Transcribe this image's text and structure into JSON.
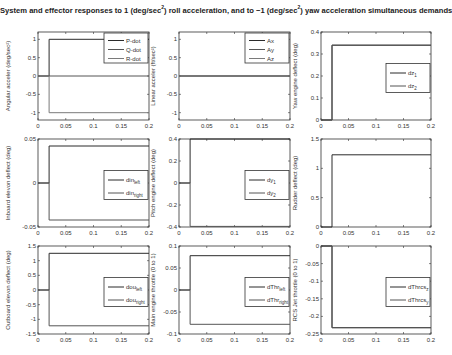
{
  "figure": {
    "title_parts": [
      "System and effector responses to 1 (deg/sec",
      "2",
      ") roll acceleration, and to −1 (deg/sec",
      "2",
      ") yaw acceleration simultaneous demands"
    ]
  },
  "chart_data": [
    {
      "type": "line",
      "id": "angular-accel",
      "ylabel": "Angular acceler (deg/sec²)",
      "xlim": [
        0,
        0.2
      ],
      "ylim": [
        -1.2,
        1.2
      ],
      "xticks": [
        0,
        0.05,
        0.1,
        0.15,
        0.2
      ],
      "xticklabels": [
        "0",
        "0.05",
        "0.1",
        "0.15",
        "0.2"
      ],
      "yticks": [
        -1,
        -0.5,
        0,
        0.5,
        1
      ],
      "yticklabels": [
        "-1",
        "-0.5",
        "0",
        "0.5",
        "1"
      ],
      "legend": {
        "position": "upper-right",
        "entries": [
          {
            "label": "P-dot"
          },
          {
            "label": "Q-dot"
          },
          {
            "label": "R-dot"
          }
        ]
      },
      "series": [
        {
          "name": "P-dot",
          "x": [
            0,
            0.02,
            0.02,
            0.2
          ],
          "y": [
            0,
            0,
            1,
            1
          ]
        },
        {
          "name": "Q-dot",
          "x": [
            0,
            0.2
          ],
          "y": [
            0,
            0
          ]
        },
        {
          "name": "R-dot",
          "x": [
            0,
            0.02,
            0.02,
            0.2
          ],
          "y": [
            0,
            0,
            -1,
            -1
          ]
        }
      ]
    },
    {
      "type": "line",
      "id": "linear-accel",
      "ylabel": "Linear acceler (ft/sec²)",
      "xlim": [
        0,
        0.2
      ],
      "ylim": [
        -1.2,
        1.2
      ],
      "xticks": [
        0,
        0.05,
        0.1,
        0.15,
        0.2
      ],
      "xticklabels": [
        "0",
        "0.05",
        "0.1",
        "0.15",
        "0.2"
      ],
      "yticks": [
        -1,
        -0.5,
        0,
        0.5,
        1
      ],
      "yticklabels": [
        "-1",
        "-0.5",
        "0",
        "0.5",
        "1"
      ],
      "legend": {
        "position": "upper-right",
        "entries": [
          {
            "label": "Ax"
          },
          {
            "label": "Ay"
          },
          {
            "label": "Az"
          }
        ]
      },
      "series": [
        {
          "name": "Ax",
          "x": [
            0,
            0.2
          ],
          "y": [
            0,
            0
          ]
        },
        {
          "name": "Ay",
          "x": [
            0,
            0.2
          ],
          "y": [
            0,
            0
          ]
        },
        {
          "name": "Az",
          "x": [
            0,
            0.2
          ],
          "y": [
            0,
            0
          ]
        }
      ]
    },
    {
      "type": "line",
      "id": "yaw-engine-deflect",
      "ylabel": "Yaw engine deflect (deg)",
      "xlim": [
        0,
        0.2
      ],
      "ylim": [
        0,
        0.4
      ],
      "xticks": [
        0,
        0.05,
        0.1,
        0.15,
        0.2
      ],
      "xticklabels": [
        "0",
        "0.05",
        "0.1",
        "0.15",
        "0.2"
      ],
      "yticks": [
        0,
        0.1,
        0.2,
        0.3,
        0.4
      ],
      "yticklabels": [
        "0",
        "0.1",
        "0.2",
        "0.3",
        "0.4"
      ],
      "legend": {
        "position": "right",
        "entries": [
          {
            "label": "dz",
            "sub": "1"
          },
          {
            "label": "dz",
            "sub": "2"
          }
        ]
      },
      "series": [
        {
          "name": "dz1",
          "x": [
            0,
            0.02,
            0.02,
            0.2
          ],
          "y": [
            0,
            0,
            0.34,
            0.34
          ]
        },
        {
          "name": "dz2",
          "x": [
            0,
            0.02,
            0.02,
            0.2
          ],
          "y": [
            0,
            0,
            0.34,
            0.34
          ]
        }
      ]
    },
    {
      "type": "line",
      "id": "inboard-elevon-deflect",
      "ylabel": "Inboard elevon deflect (deg)",
      "xlim": [
        0,
        0.2
      ],
      "ylim": [
        -0.05,
        0.05
      ],
      "xticks": [
        0,
        0.05,
        0.1,
        0.15,
        0.2
      ],
      "xticklabels": [
        "0",
        "0.05",
        "0.1",
        "0.15",
        "0.2"
      ],
      "yticks": [
        -0.05,
        0,
        0.05
      ],
      "yticklabels": [
        "-0.05",
        "0",
        "0.05"
      ],
      "legend": {
        "position": "right",
        "entries": [
          {
            "label": "din",
            "sub": "left"
          },
          {
            "label": "din",
            "sub": "right"
          }
        ]
      },
      "series": [
        {
          "name": "din_left",
          "x": [
            0,
            0.02,
            0.02,
            0.2
          ],
          "y": [
            0,
            0,
            0.042,
            0.042
          ]
        },
        {
          "name": "din_right",
          "x": [
            0,
            0.02,
            0.02,
            0.2
          ],
          "y": [
            0,
            0,
            -0.042,
            -0.042
          ]
        }
      ]
    },
    {
      "type": "line",
      "id": "pitch-engine-deflect",
      "ylabel": "Pitch engine deflect (deg)",
      "xlim": [
        0,
        0.2
      ],
      "ylim": [
        -0.4,
        0.4
      ],
      "xticks": [
        0,
        0.05,
        0.1,
        0.15,
        0.2
      ],
      "xticklabels": [
        "0",
        "0.05",
        "0.1",
        "0.15",
        "0.2"
      ],
      "yticks": [
        -0.4,
        -0.2,
        0,
        0.2,
        0.4
      ],
      "yticklabels": [
        "-0.4",
        "-0.2",
        "0",
        "0.2",
        "0.4"
      ],
      "legend": {
        "position": "right",
        "entries": [
          {
            "label": "dy",
            "sub": "1"
          },
          {
            "label": "dy",
            "sub": "2"
          }
        ]
      },
      "series": [
        {
          "name": "dy1",
          "x": [
            0,
            0.02,
            0.02,
            0.2
          ],
          "y": [
            0,
            0,
            0.4,
            0.4
          ]
        },
        {
          "name": "dy2",
          "x": [
            0,
            0.02,
            0.02,
            0.2
          ],
          "y": [
            0,
            0,
            -0.395,
            -0.395
          ]
        }
      ]
    },
    {
      "type": "line",
      "id": "rudder-deflect",
      "ylabel": "Rudder deflect (deg)",
      "xlim": [
        0,
        0.2
      ],
      "ylim": [
        0,
        1.5
      ],
      "xticks": [
        0,
        0.05,
        0.1,
        0.15,
        0.2
      ],
      "xticklabels": [
        "0",
        "0.05",
        "0.1",
        "0.15",
        "0.2"
      ],
      "yticks": [
        0,
        0.5,
        1,
        1.5
      ],
      "yticklabels": [
        "0",
        "0.5",
        "1",
        "1.5"
      ],
      "legend": null,
      "series": [
        {
          "name": "rudder",
          "x": [
            0,
            0.02,
            0.02,
            0.2
          ],
          "y": [
            0,
            0,
            1.23,
            1.23
          ]
        }
      ]
    },
    {
      "type": "line",
      "id": "outboard-elevon-deflect",
      "ylabel": "Outboard elevon deflect (deg)",
      "xlim": [
        0,
        0.2
      ],
      "ylim": [
        -1.5,
        1.5
      ],
      "xticks": [
        0,
        0.05,
        0.1,
        0.15,
        0.2
      ],
      "xticklabels": [
        "0",
        "0.05",
        "0.1",
        "0.15",
        "0.2"
      ],
      "yticks": [
        -1.5,
        -1,
        -0.5,
        0,
        0.5,
        1,
        1.5
      ],
      "yticklabels": [
        "-1.5",
        "-1",
        "-0.5",
        "0",
        "0.5",
        "1",
        "1.5"
      ],
      "legend": {
        "position": "right",
        "entries": [
          {
            "label": "dou",
            "sub": "left"
          },
          {
            "label": "dou",
            "sub": "right"
          }
        ]
      },
      "series": [
        {
          "name": "dou_left",
          "x": [
            0,
            0.02,
            0.02,
            0.2
          ],
          "y": [
            0,
            0,
            1.25,
            1.25
          ]
        },
        {
          "name": "dou_right",
          "x": [
            0,
            0.02,
            0.02,
            0.2
          ],
          "y": [
            0,
            0,
            -1.22,
            -1.22
          ]
        }
      ]
    },
    {
      "type": "line",
      "id": "main-engine-throttle",
      "ylabel": "Main engine throttle (0 to 1)",
      "xlim": [
        0,
        0.2
      ],
      "ylim": [
        -0.1,
        0.1
      ],
      "xticks": [
        0,
        0.05,
        0.1,
        0.15,
        0.2
      ],
      "xticklabels": [
        "0",
        "0.05",
        "0.1",
        "0.15",
        "0.2"
      ],
      "yticks": [
        -0.1,
        -0.05,
        0,
        0.05,
        0.1
      ],
      "yticklabels": [
        "-0.1",
        "-0.05",
        "0",
        "0.05",
        "0.1"
      ],
      "legend": {
        "position": "right",
        "entries": [
          {
            "label": "dThr",
            "sub": "left"
          },
          {
            "label": "dThr",
            "sub": "right"
          }
        ]
      },
      "series": [
        {
          "name": "dThr_left",
          "x": [
            0,
            0.02,
            0.02,
            0.2
          ],
          "y": [
            0,
            0,
            0.078,
            0.078
          ]
        },
        {
          "name": "dThr_right",
          "x": [
            0,
            0.02,
            0.02,
            0.2
          ],
          "y": [
            0,
            0,
            -0.078,
            -0.078
          ]
        }
      ]
    },
    {
      "type": "line",
      "id": "rcs-jet-throttle",
      "ylabel": "RCS Jet throttle (0 to 1)",
      "xlim": [
        0,
        0.2
      ],
      "ylim": [
        -0.25,
        0
      ],
      "xticks": [
        0,
        0.05,
        0.1,
        0.15,
        0.2
      ],
      "xticklabels": [
        "0",
        "0.05",
        "0.1",
        "0.15",
        "0.2"
      ],
      "yticks": [
        -0.25,
        -0.2,
        -0.15,
        -0.1,
        -0.05,
        0
      ],
      "yticklabels": [
        "-0.25",
        "-0.2",
        "-0.15",
        "-0.1",
        "-0.05",
        "0"
      ],
      "legend": {
        "position": "right",
        "entries": [
          {
            "label": "dThrcs",
            "sub": "z"
          },
          {
            "label": "dThrcs",
            "sub": "y"
          }
        ]
      },
      "series": [
        {
          "name": "dThrcs_z",
          "x": [
            0,
            0.02,
            0.02,
            0.2
          ],
          "y": [
            0,
            0,
            -0.232,
            -0.232
          ]
        },
        {
          "name": "dThrcs_y",
          "x": [
            0,
            0.02,
            0.02,
            0.2
          ],
          "y": [
            0,
            0,
            -0.232,
            -0.232
          ]
        }
      ]
    }
  ]
}
